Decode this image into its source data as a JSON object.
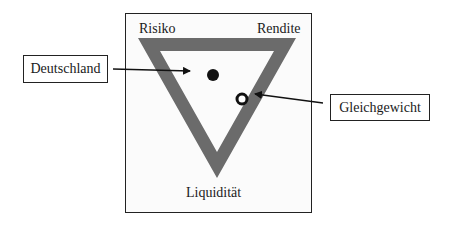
{
  "diagram": {
    "type": "magic-triangle",
    "corners": {
      "top_left": "Risiko",
      "top_right": "Rendite",
      "bottom": "Liquidität"
    },
    "callouts": [
      {
        "label": "Deutschland",
        "marker": "filled-dot"
      },
      {
        "label": "Gleichgewicht",
        "marker": "hollow-ring"
      }
    ],
    "colors": {
      "triangle_band": "#6b6b6b",
      "frame": "#222222",
      "marker": "#111111"
    }
  }
}
